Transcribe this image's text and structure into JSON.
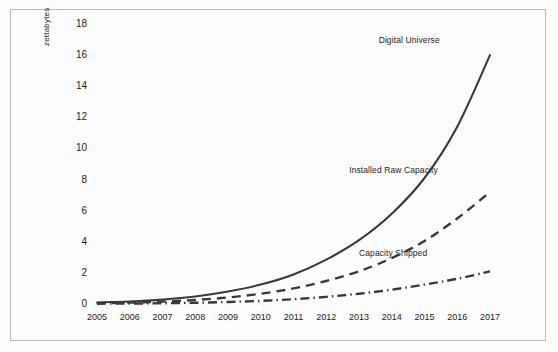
{
  "chart_data": {
    "type": "line",
    "title": "",
    "xlabel": "",
    "ylabel": "zettabytes",
    "categories": [
      "2005",
      "2006",
      "2007",
      "2008",
      "2009",
      "2010",
      "2011",
      "2012",
      "2013",
      "2014",
      "2015",
      "2016",
      "2017"
    ],
    "x": [
      2005,
      2006,
      2007,
      2008,
      2009,
      2010,
      2011,
      2012,
      2013,
      2014,
      2015,
      2016,
      2017
    ],
    "xlim": [
      2005,
      2017
    ],
    "ylim": [
      0,
      18
    ],
    "yticks": [
      0,
      2,
      4,
      6,
      8,
      10,
      12,
      14,
      16,
      18
    ],
    "xticks": [
      "2005",
      "2006",
      "2007",
      "2008",
      "2009",
      "2010",
      "2011",
      "2012",
      "2013",
      "2014",
      "2015",
      "2016",
      "2017"
    ],
    "grid": false,
    "legend_position": "inline-annotations",
    "series": [
      {
        "name": "Digital Universe",
        "linestyle": "solid",
        "color": "#3a3a3a",
        "label_x": 2013.6,
        "label_y": 17.0,
        "values": [
          0.1,
          0.16,
          0.28,
          0.48,
          0.8,
          1.25,
          1.9,
          2.85,
          4.1,
          5.8,
          8.1,
          11.4,
          16.0
        ]
      },
      {
        "name": "Installed Raw Capacity",
        "linestyle": "dashed",
        "color": "#3a3a3a",
        "label_x": 2012.7,
        "label_y": 8.6,
        "values": [
          0.05,
          0.09,
          0.15,
          0.26,
          0.42,
          0.66,
          1.0,
          1.48,
          2.1,
          2.95,
          4.05,
          5.5,
          7.2
        ]
      },
      {
        "name": "Capacity Shipped",
        "linestyle": "dashdot",
        "color": "#3a3a3a",
        "label_x": 2013.0,
        "label_y": 3.3,
        "values": [
          0.02,
          0.03,
          0.05,
          0.08,
          0.13,
          0.2,
          0.31,
          0.46,
          0.66,
          0.92,
          1.25,
          1.62,
          2.1
        ]
      }
    ]
  },
  "axes": {
    "y_axis_title": "zettabytes"
  }
}
